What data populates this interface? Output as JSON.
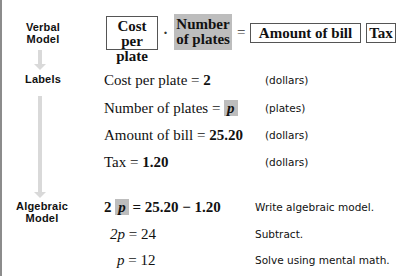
{
  "steps": {
    "verbal": {
      "line1": "Verbal",
      "line2": "Model"
    },
    "labels": {
      "line1": "Labels"
    },
    "algebraic": {
      "line1": "Algebraic",
      "line2": "Model"
    }
  },
  "verbal_model": {
    "box1_line1": "Cost per",
    "box1_line2": "plate",
    "op_times": "·",
    "box2_line1": "Number",
    "box2_line2": "of plates",
    "op_equals": "=",
    "box3": "Amount of bill",
    "op_minus": "−",
    "box4": "Tax"
  },
  "labels": [
    {
      "name": "Cost per plate",
      "eq": " = ",
      "value": "2",
      "unit": "(dollars)"
    },
    {
      "name": "Number of plates",
      "eq": " = ",
      "value": "p",
      "unit": "(plates)"
    },
    {
      "name": "Amount of bill",
      "eq": " = ",
      "value": "25.20",
      "unit": "(dollars)"
    },
    {
      "name": "Tax",
      "eq": " = ",
      "value": "1.20",
      "unit": "(dollars)"
    }
  ],
  "algebra": [
    {
      "lhs_coef": "2",
      "lhs_var": "p",
      "rhs": " = 25.20 − 1.20",
      "note": "Write algebraic model."
    },
    {
      "lhs": "2p",
      "rhs": " = 24",
      "note": "Subtract."
    },
    {
      "lhs": "p",
      "rhs": " = 12",
      "note": "Solve using mental math."
    }
  ],
  "colors": {
    "highlight": "#bdbdbd",
    "arrow": "#d9d9d9",
    "rule": "#8c8c8c"
  }
}
